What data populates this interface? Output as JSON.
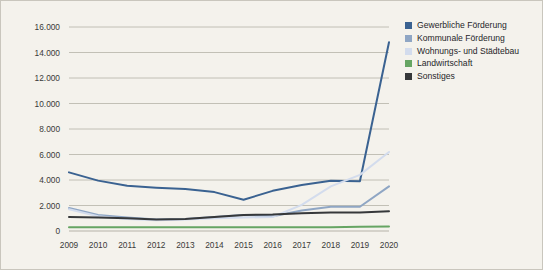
{
  "chart_data": {
    "type": "line",
    "title": "",
    "subtitle": "",
    "xlabel": "",
    "ylabel": "",
    "categories": [
      "2009",
      "2010",
      "2011",
      "2012",
      "2013",
      "2014",
      "2015",
      "2016",
      "2017",
      "2018",
      "2019",
      "2020"
    ],
    "x": [
      2009,
      2010,
      2011,
      2012,
      2013,
      2014,
      2015,
      2016,
      2017,
      2018,
      2019,
      2020
    ],
    "ylim": [
      0,
      16000
    ],
    "yticks": [
      0,
      2000,
      4000,
      6000,
      8000,
      10000,
      12000,
      14000,
      16000
    ],
    "ytick_labels": [
      "0",
      "2.000",
      "4.000",
      "6.000",
      "8.000",
      "10.000",
      "12.000",
      "14.000",
      "16.000"
    ],
    "grid": true,
    "legend_position": "right",
    "series": [
      {
        "name": "Gewerbliche Förderung",
        "color": "#3a6291",
        "values": [
          4600,
          3950,
          3550,
          3400,
          3300,
          3050,
          2450,
          3150,
          3600,
          3950,
          3900,
          14800
        ]
      },
      {
        "name": "Kommunale Förderung",
        "color": "#8fa6c4",
        "values": [
          1800,
          1250,
          1050,
          900,
          950,
          1100,
          1250,
          1150,
          1600,
          1900,
          1900,
          3500
        ]
      },
      {
        "name": "Wohnungs- und Städtebau",
        "color": "#d3dced",
        "values": [
          1700,
          1150,
          950,
          850,
          900,
          1000,
          1050,
          1100,
          2050,
          3500,
          4400,
          6200
        ]
      },
      {
        "name": "Landwirtschaft",
        "color": "#66a563",
        "values": [
          300,
          300,
          300,
          300,
          300,
          300,
          300,
          300,
          300,
          300,
          330,
          350
        ]
      },
      {
        "name": "Sonstiges",
        "color": "#36383a",
        "values": [
          1100,
          1050,
          1000,
          900,
          950,
          1100,
          1250,
          1300,
          1400,
          1450,
          1450,
          1550
        ]
      }
    ]
  },
  "legend": {
    "items": [
      {
        "label": "Gewerbliche Förderung",
        "color": "#3a6291"
      },
      {
        "label": "Kommunale Förderung",
        "color": "#8fa6c4"
      },
      {
        "label": "Wohnungs- und Städtebau",
        "color": "#d3dced"
      },
      {
        "label": "Landwirtschaft",
        "color": "#66a563"
      },
      {
        "label": "Sonstiges",
        "color": "#36383a"
      }
    ]
  },
  "colors": {
    "background": "#f4f2ec",
    "border": "#c9c6bd",
    "gridline": "#b5b2a8",
    "axis_text": "#3a3a38"
  }
}
